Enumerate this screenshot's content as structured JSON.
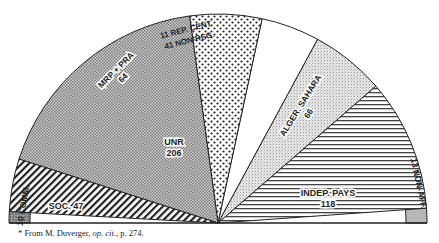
{
  "chart_data": {
    "type": "pie",
    "subtype": "semicircle-parliament",
    "title": "",
    "total_seats": 576,
    "segments": [
      {
        "label": "10 COMM.",
        "value": 10,
        "pattern": "dense-dots",
        "ring": "outer-band"
      },
      {
        "label": "SOC. 47",
        "value": 47,
        "pattern": "diagonal-hatch"
      },
      {
        "label": "UNR 206",
        "value": 206,
        "pattern": "checker-grey"
      },
      {
        "label": "MRP + PRA 64",
        "value": 64,
        "pattern": "sparse-dots"
      },
      {
        "label": "11 REP. CENT. / 41 NON-REG.",
        "value": 52,
        "pattern": "white"
      },
      {
        "label": "ALGER. SAHARA 66",
        "value": 66,
        "pattern": "fine-stipple"
      },
      {
        "label": "INDEP. PAYS 118",
        "value": 118,
        "pattern": "horizontal-lines"
      },
      {
        "label": "13 NON-AFF.",
        "value": 13,
        "pattern": "grey",
        "ring": "outer-band"
      }
    ]
  },
  "labels": {
    "comm": "10 COMM.",
    "soc": "SOC. 47",
    "unr_name": "UNR",
    "unr_value": "206",
    "mrp_name": "MRP + PRA",
    "mrp_value": "64",
    "rep_line1": "11 REP. CENT.",
    "rep_line2": "41 NON-REG.",
    "alger_name": "ALGER. SAHARA",
    "alger_value": "66",
    "indep_name": "INDEP. PAYS",
    "indep_value": "118",
    "nonaff": "13 NON-AFF."
  },
  "footnote": {
    "prefix": "* From M. Duverger, ",
    "italic": "op. cit.",
    "suffix": ", p. 274."
  }
}
